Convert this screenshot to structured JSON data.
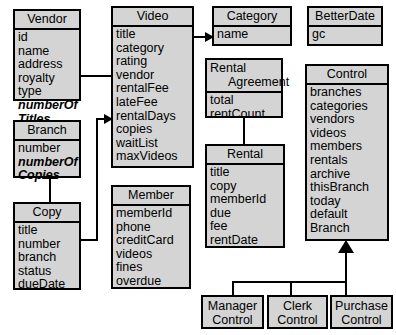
{
  "diagram": {
    "style": {
      "box_fill": "#d4d4d4",
      "box_border": "#000000",
      "background": "#ffffff",
      "text_color": "#000000"
    },
    "classes": [
      {
        "id": "vendor",
        "name": "Vendor",
        "attributes": [
          "id",
          "name",
          "address",
          "royalty",
          "type",
          "numberOf\nTitles"
        ]
      },
      {
        "id": "video",
        "name": "Video",
        "attributes": [
          "title",
          "category",
          "rating",
          "vendor",
          "rentalFee",
          "lateFee",
          "rentalDays",
          "copies",
          "waitList",
          "maxVideos"
        ]
      },
      {
        "id": "category",
        "name": "Category",
        "attributes": [
          "name"
        ]
      },
      {
        "id": "betterdate",
        "name": "BetterDate",
        "attributes": [
          "gc"
        ]
      },
      {
        "id": "branch",
        "name": "Branch",
        "attributes": [
          "number",
          "numberOf\nCopies"
        ]
      },
      {
        "id": "rental-agreement",
        "name": "Rental\nAgreement",
        "attributes": [
          "total",
          "rentCount"
        ]
      },
      {
        "id": "control",
        "name": "Control",
        "attributes": [
          "branches",
          "categories",
          "vendors",
          "videos",
          "members",
          "rentals",
          "archive",
          "thisBranch",
          "today",
          "default\nBranch"
        ]
      },
      {
        "id": "copy",
        "name": "Copy",
        "attributes": [
          "title",
          "number",
          "branch",
          "status",
          "dueDate"
        ]
      },
      {
        "id": "member",
        "name": "Member",
        "attributes": [
          "memberId",
          "phone",
          "creditCard",
          "videos",
          "fines",
          "overdue"
        ]
      },
      {
        "id": "rental",
        "name": "Rental",
        "attributes": [
          "title",
          "copy",
          "memberId",
          "due",
          "fee",
          "rentDate"
        ]
      },
      {
        "id": "manager-control",
        "name": "Manager\nControl",
        "attributes": []
      },
      {
        "id": "clerk-control",
        "name": "Clerk\nControl",
        "attributes": []
      },
      {
        "id": "purchase-control",
        "name": "Purchase\nControl",
        "attributes": []
      }
    ],
    "relationships": [
      {
        "id": "video-to-vendor",
        "from": "video",
        "to": "vendor",
        "type": "association"
      },
      {
        "id": "video-to-category",
        "from": "video",
        "to": "category",
        "type": "association"
      },
      {
        "id": "copy-to-video",
        "from": "copy",
        "to": "video",
        "type": "association"
      },
      {
        "id": "copy-to-branch",
        "from": "copy",
        "to": "branch",
        "type": "generalization"
      },
      {
        "id": "rental-agreement-to-rental",
        "from": "rental-agreement",
        "to": "rental",
        "type": "association"
      },
      {
        "id": "manager-control-to-control",
        "from": "manager-control",
        "to": "control",
        "type": "generalization"
      },
      {
        "id": "clerk-control-to-control",
        "from": "clerk-control",
        "to": "control",
        "type": "generalization"
      },
      {
        "id": "purchase-control-to-control",
        "from": "purchase-control",
        "to": "control",
        "type": "generalization"
      }
    ]
  }
}
